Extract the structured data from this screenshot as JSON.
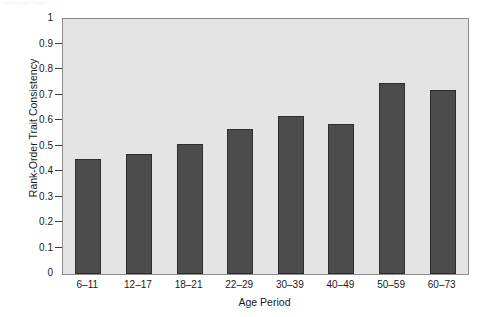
{
  "figure": {
    "caption_remnant": "Academic Press",
    "background_color": "#ffffff",
    "plot_background_color": "#e4e4e4",
    "bar_color": "#4c4c4c",
    "bar_edge_color": "#2e2e2e",
    "axis_color": "#8a8a8a"
  },
  "chart_data": {
    "type": "bar",
    "title": "",
    "xlabel": "Age Period",
    "ylabel": "Rank-Order Trait Consistency",
    "categories": [
      "6–11",
      "12–17",
      "18–21",
      "22–29",
      "30–39",
      "40–49",
      "50–59",
      "60–73"
    ],
    "values": [
      0.45,
      0.47,
      0.51,
      0.57,
      0.62,
      0.59,
      0.75,
      0.72
    ],
    "ylim": [
      0,
      1
    ],
    "yticks": [
      0,
      0.1,
      0.2,
      0.3,
      0.4,
      0.5,
      0.6,
      0.7,
      0.8,
      0.9,
      1
    ],
    "ytick_labels": [
      "0",
      "0.1",
      "0.2",
      "0.3",
      "0.4",
      "0.5",
      "0.6",
      "0.7",
      "0.8",
      "0.9",
      "1"
    ],
    "grid": false,
    "legend": null,
    "legend_position": "none",
    "series": [
      {
        "name": "Rank-Order Trait Consistency",
        "values": [
          0.45,
          0.47,
          0.51,
          0.57,
          0.62,
          0.59,
          0.75,
          0.72
        ]
      }
    ]
  }
}
